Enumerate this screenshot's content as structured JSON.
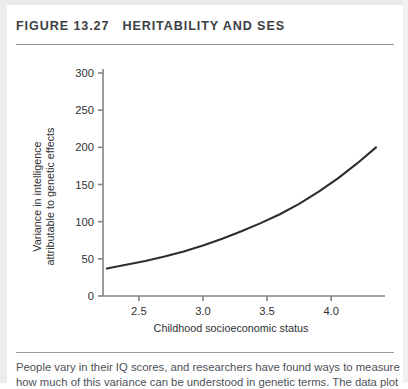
{
  "figure": {
    "number_label": "FIGURE 13.27",
    "title": "HERITABILITY AND SES"
  },
  "caption": {
    "line1": "People vary in their IQ scores, and researchers have found ways to measure",
    "line2": "how much of this variance can be understood in genetic terms. The data plot"
  },
  "chart_data": {
    "type": "line",
    "title": "",
    "xlabel": "Childhood socioeconomic status",
    "ylabel": "Variance in intelligence attributable to genetic effects",
    "ylabel_line1": "Variance in intelligence",
    "ylabel_line2": "attributable to genetic effects",
    "xlim": [
      2.22,
      4.42
    ],
    "ylim": [
      0,
      300
    ],
    "xticks": [
      2.5,
      3.0,
      3.5,
      4.0
    ],
    "xtick_labels": [
      "2.5",
      "3.0",
      "3.5",
      "4.0"
    ],
    "yticks": [
      0,
      50,
      100,
      150,
      200,
      250,
      300
    ],
    "ytick_labels": [
      "0",
      "50",
      "100",
      "150",
      "200",
      "250",
      "300"
    ],
    "grid": false,
    "legend": "none",
    "line_color": "#2e2e2e",
    "axis_color": "#808387",
    "series": [
      {
        "name": "Genetic variance",
        "x": [
          2.25,
          2.4,
          2.55,
          2.7,
          2.85,
          3.0,
          3.15,
          3.3,
          3.45,
          3.6,
          3.75,
          3.9,
          4.05,
          4.2,
          4.35
        ],
        "y": [
          37,
          42,
          47,
          53,
          60,
          68,
          77,
          87,
          98,
          110,
          124,
          140,
          158,
          178,
          200
        ]
      }
    ]
  }
}
